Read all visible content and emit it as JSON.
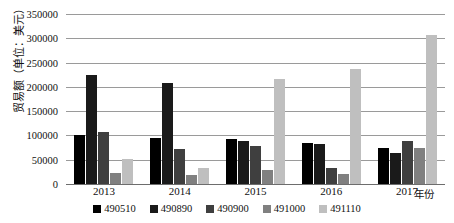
{
  "chart_data": {
    "type": "bar",
    "title": "",
    "xlabel": "年份",
    "ylabel": "贸易额（单位：美元）",
    "ylim": [
      0,
      350000
    ],
    "ytick_step": 50000,
    "yticks": [
      "0",
      "50000",
      "100000",
      "150000",
      "200000",
      "250000",
      "300000",
      "350000"
    ],
    "ytick_values": [
      0,
      50000,
      100000,
      150000,
      200000,
      250000,
      300000,
      350000
    ],
    "grid": true,
    "legend_position": "bottom",
    "categories": [
      "2013",
      "2014",
      "2015",
      "2016",
      "2017"
    ],
    "series": [
      {
        "name": "490510",
        "color": "#000000",
        "values": [
          100000,
          95000,
          93000,
          84000,
          75000
        ]
      },
      {
        "name": "490890",
        "color": "#1a1a1a",
        "values": [
          224000,
          207000,
          88000,
          83000,
          64000
        ]
      },
      {
        "name": "490900",
        "color": "#3f3f3f",
        "values": [
          108000,
          72000,
          78000,
          33000,
          88000
        ]
      },
      {
        "name": "491000",
        "color": "#808080",
        "values": [
          22000,
          18000,
          28000,
          20000,
          75000
        ]
      },
      {
        "name": "491110",
        "color": "#bfbfbf",
        "values": [
          52000,
          32000,
          217000,
          237000,
          307000
        ]
      }
    ]
  },
  "axis": {
    "x_title": "年份",
    "y_title": "贸易额（单位：美元）"
  }
}
